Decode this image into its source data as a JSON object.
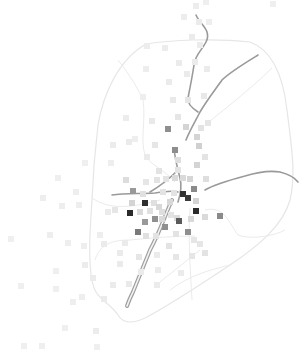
{
  "map": {
    "width": 308,
    "height": 350,
    "background": "#ffffff",
    "boundary_color": "#e6e6e6",
    "road_color": "#9a9a9a",
    "boundary": "M146,44 C170,40 215,38 250,42 C272,50 283,75 287,110 C292,150 296,175 290,200 C283,225 260,245 230,265 C200,285 170,305 145,318 C130,325 122,322 118,315 C108,300 95,300 92,280 C88,260 90,230 92,200 C93,175 95,150 98,125 C103,95 118,60 146,44 Z",
    "districts": [
      "M118,60 C130,75 140,92 143,100 C146,120 140,140 145,155 C150,165 165,170 175,182",
      "M272,68 C255,85 230,105 205,125",
      "M92,198 C110,210 130,208 160,200",
      "M95,260 C100,245 110,240 130,240 C150,238 175,236 195,236",
      "M160,282 C175,270 185,262 200,250",
      "M190,208 C188,235 190,265 192,300",
      "M205,210 C225,205 230,225 238,235 C250,240 275,236 285,230",
      "M230,265 C210,270 190,275 170,290"
    ],
    "roads": [
      "M196,15 C200,25 212,30 206,42 C202,50 195,55 194,65 C192,78 190,88 188,98 C187,103 192,108 198,112",
      "M258,55 C245,63 230,72 222,80 C215,90 207,100 200,112 C196,120 190,130 186,140",
      "M174,148 C175,160 178,170 180,178 C182,186 180,196 178,202",
      "M205,190 C215,184 230,180 245,176 C258,172 268,170 280,172 C288,174 295,178 298,182",
      "M112,195 C125,193 140,194 155,193 C165,192 172,190 178,192",
      "M176,172 C168,180 160,186 150,192"
    ],
    "highway": "M172,200 C165,215 160,232 150,250 C144,265 138,280 133,292 C130,298 128,303 127,306",
    "points": [
      {
        "x": 196,
        "y": 6,
        "c": "#ededed"
      },
      {
        "x": 206,
        "y": 2,
        "c": "#efefef"
      },
      {
        "x": 184,
        "y": 17,
        "c": "#ededed"
      },
      {
        "x": 199,
        "y": 22,
        "c": "#ebebeb"
      },
      {
        "x": 209,
        "y": 22,
        "c": "#eeeeee"
      },
      {
        "x": 192,
        "y": 37,
        "c": "#ebebeb"
      },
      {
        "x": 200,
        "y": 45,
        "c": "#ececec"
      },
      {
        "x": 273,
        "y": 4,
        "c": "#efefef"
      },
      {
        "x": 147,
        "y": 46,
        "c": "#ededed"
      },
      {
        "x": 165,
        "y": 48,
        "c": "#ededed"
      },
      {
        "x": 179,
        "y": 63,
        "c": "#ebebeb"
      },
      {
        "x": 195,
        "y": 62,
        "c": "#ebebeb"
      },
      {
        "x": 207,
        "y": 69,
        "c": "#ebebeb"
      },
      {
        "x": 146,
        "y": 69,
        "c": "#ededed"
      },
      {
        "x": 169,
        "y": 82,
        "c": "#ebebeb"
      },
      {
        "x": 187,
        "y": 74,
        "c": "#ebebeb"
      },
      {
        "x": 173,
        "y": 100,
        "c": "#e9e9e9"
      },
      {
        "x": 188,
        "y": 100,
        "c": "#e6e6e6"
      },
      {
        "x": 204,
        "y": 96,
        "c": "#e8e8e8"
      },
      {
        "x": 143,
        "y": 97,
        "c": "#eeeeee"
      },
      {
        "x": 126,
        "y": 118,
        "c": "#ececec"
      },
      {
        "x": 152,
        "y": 121,
        "c": "#e9e9e9"
      },
      {
        "x": 178,
        "y": 117,
        "c": "#e6e6e6"
      },
      {
        "x": 186,
        "y": 127,
        "c": "#d4d4d4"
      },
      {
        "x": 208,
        "y": 123,
        "c": "#e6e6e6"
      },
      {
        "x": 201,
        "y": 128,
        "c": "#e3e3e3"
      },
      {
        "x": 168,
        "y": 129,
        "c": "#8f8f8f"
      },
      {
        "x": 197,
        "y": 137,
        "c": "#d4d4d4"
      },
      {
        "x": 199,
        "y": 146,
        "c": "#d0d0d0"
      },
      {
        "x": 205,
        "y": 157,
        "c": "#e3e3e3"
      },
      {
        "x": 113,
        "y": 145,
        "c": "#ececec"
      },
      {
        "x": 129,
        "y": 142,
        "c": "#ebebeb"
      },
      {
        "x": 135,
        "y": 139,
        "c": "#eeeeee"
      },
      {
        "x": 155,
        "y": 145,
        "c": "#e6e6e6"
      },
      {
        "x": 175,
        "y": 150,
        "c": "#8d8d8d"
      },
      {
        "x": 197,
        "y": 165,
        "c": "#d4d4d4"
      },
      {
        "x": 178,
        "y": 160,
        "c": "#dedede"
      },
      {
        "x": 178,
        "y": 170,
        "c": "#e3e3e3"
      },
      {
        "x": 159,
        "y": 171,
        "c": "#e3e3e3"
      },
      {
        "x": 147,
        "y": 157,
        "c": "#ebebeb"
      },
      {
        "x": 111,
        "y": 163,
        "c": "#eeeeee"
      },
      {
        "x": 85,
        "y": 163,
        "c": "#efefef"
      },
      {
        "x": 126,
        "y": 180,
        "c": "#dddddd"
      },
      {
        "x": 146,
        "y": 182,
        "c": "#e6e6e6"
      },
      {
        "x": 157,
        "y": 180,
        "c": "#e3e3e3"
      },
      {
        "x": 166,
        "y": 179,
        "c": "#e3e3e3"
      },
      {
        "x": 175,
        "y": 178,
        "c": "#dadada"
      },
      {
        "x": 183,
        "y": 178,
        "c": "#dadada"
      },
      {
        "x": 190,
        "y": 179,
        "c": "#d6d6d6"
      },
      {
        "x": 206,
        "y": 179,
        "c": "#dedede"
      },
      {
        "x": 133,
        "y": 191,
        "c": "#999999"
      },
      {
        "x": 143,
        "y": 194,
        "c": "#e0e0e0"
      },
      {
        "x": 163,
        "y": 192,
        "c": "#e3e3e3"
      },
      {
        "x": 174,
        "y": 193,
        "c": "#e3e3e3"
      },
      {
        "x": 183,
        "y": 194,
        "c": "#333333"
      },
      {
        "x": 188,
        "y": 198,
        "c": "#3a3a3a"
      },
      {
        "x": 194,
        "y": 189,
        "c": "#8a8a8a"
      },
      {
        "x": 196,
        "y": 201,
        "c": "#d4d4d4"
      },
      {
        "x": 132,
        "y": 203,
        "c": "#d4d4d4"
      },
      {
        "x": 145,
        "y": 203,
        "c": "#2e2e2e"
      },
      {
        "x": 154,
        "y": 203,
        "c": "#e0e0e0"
      },
      {
        "x": 159,
        "y": 207,
        "c": "#d8d8d8"
      },
      {
        "x": 170,
        "y": 202,
        "c": "#d8d8d8"
      },
      {
        "x": 130,
        "y": 213,
        "c": "#2a2a2a"
      },
      {
        "x": 140,
        "y": 212,
        "c": "#dadada"
      },
      {
        "x": 150,
        "y": 211,
        "c": "#e0e0e0"
      },
      {
        "x": 162,
        "y": 212,
        "c": "#dedede"
      },
      {
        "x": 196,
        "y": 211,
        "c": "#2c2c2c"
      },
      {
        "x": 171,
        "y": 215,
        "c": "#e3e3e3"
      },
      {
        "x": 177,
        "y": 218,
        "c": "#dcdcdc"
      },
      {
        "x": 115,
        "y": 210,
        "c": "#e6e6e6"
      },
      {
        "x": 205,
        "y": 217,
        "c": "#dadada"
      },
      {
        "x": 220,
        "y": 216,
        "c": "#8a8a8a"
      },
      {
        "x": 145,
        "y": 222,
        "c": "#999999"
      },
      {
        "x": 155,
        "y": 219,
        "c": "#8f8f8f"
      },
      {
        "x": 162,
        "y": 219,
        "c": "#dadada"
      },
      {
        "x": 179,
        "y": 221,
        "c": "#5a5a5a"
      },
      {
        "x": 191,
        "y": 219,
        "c": "#dadada"
      },
      {
        "x": 165,
        "y": 227,
        "c": "#8f8f8f"
      },
      {
        "x": 138,
        "y": 232,
        "c": "#7a7a7a"
      },
      {
        "x": 146,
        "y": 236,
        "c": "#e0e0e0"
      },
      {
        "x": 156,
        "y": 236,
        "c": "#e3e3e3"
      },
      {
        "x": 176,
        "y": 234,
        "c": "#e3e3e3"
      },
      {
        "x": 188,
        "y": 232,
        "c": "#8f8f8f"
      },
      {
        "x": 194,
        "y": 240,
        "c": "#e6e6e6"
      },
      {
        "x": 169,
        "y": 246,
        "c": "#e3e3e3"
      },
      {
        "x": 200,
        "y": 244,
        "c": "#e6e6e6"
      },
      {
        "x": 205,
        "y": 253,
        "c": "#e3e3e3"
      },
      {
        "x": 125,
        "y": 243,
        "c": "#ebebeb"
      },
      {
        "x": 120,
        "y": 253,
        "c": "#ebebeb"
      },
      {
        "x": 104,
        "y": 244,
        "c": "#ebebeb"
      },
      {
        "x": 108,
        "y": 212,
        "c": "#ebebeb"
      },
      {
        "x": 100,
        "y": 235,
        "c": "#eeeeee"
      },
      {
        "x": 139,
        "y": 257,
        "c": "#e6e6e6"
      },
      {
        "x": 157,
        "y": 255,
        "c": "#ebebeb"
      },
      {
        "x": 176,
        "y": 257,
        "c": "#e6e6e6"
      },
      {
        "x": 192,
        "y": 256,
        "c": "#e6e6e6"
      },
      {
        "x": 181,
        "y": 273,
        "c": "#ebebeb"
      },
      {
        "x": 158,
        "y": 270,
        "c": "#ebebeb"
      },
      {
        "x": 141,
        "y": 272,
        "c": "#ebebeb"
      },
      {
        "x": 120,
        "y": 264,
        "c": "#ebebeb"
      },
      {
        "x": 85,
        "y": 265,
        "c": "#ececec"
      },
      {
        "x": 93,
        "y": 278,
        "c": "#ececec"
      },
      {
        "x": 113,
        "y": 285,
        "c": "#ebebeb"
      },
      {
        "x": 129,
        "y": 284,
        "c": "#e9e9e9"
      },
      {
        "x": 157,
        "y": 285,
        "c": "#ebebeb"
      },
      {
        "x": 82,
        "y": 297,
        "c": "#eeeeee"
      },
      {
        "x": 73,
        "y": 302,
        "c": "#eeeeee"
      },
      {
        "x": 104,
        "y": 299,
        "c": "#ebebeb"
      },
      {
        "x": 56,
        "y": 289,
        "c": "#efefef"
      },
      {
        "x": 43,
        "y": 198,
        "c": "#eeeeee"
      },
      {
        "x": 62,
        "y": 206,
        "c": "#eeeeee"
      },
      {
        "x": 76,
        "y": 192,
        "c": "#eeeeee"
      },
      {
        "x": 50,
        "y": 235,
        "c": "#eeeeee"
      },
      {
        "x": 68,
        "y": 243,
        "c": "#eeeeee"
      },
      {
        "x": 11,
        "y": 239,
        "c": "#efefef"
      },
      {
        "x": 56,
        "y": 271,
        "c": "#efefef"
      },
      {
        "x": 21,
        "y": 286,
        "c": "#efefef"
      },
      {
        "x": 84,
        "y": 246,
        "c": "#eeeeee"
      },
      {
        "x": 65,
        "y": 328,
        "c": "#efefef"
      },
      {
        "x": 96,
        "y": 331,
        "c": "#ececec"
      },
      {
        "x": 24,
        "y": 346,
        "c": "#efefef"
      },
      {
        "x": 42,
        "y": 346,
        "c": "#efefef"
      },
      {
        "x": 97,
        "y": 347,
        "c": "#efefef"
      },
      {
        "x": 58,
        "y": 178,
        "c": "#efefef"
      },
      {
        "x": 79,
        "y": 205,
        "c": "#eeeeee"
      }
    ]
  }
}
